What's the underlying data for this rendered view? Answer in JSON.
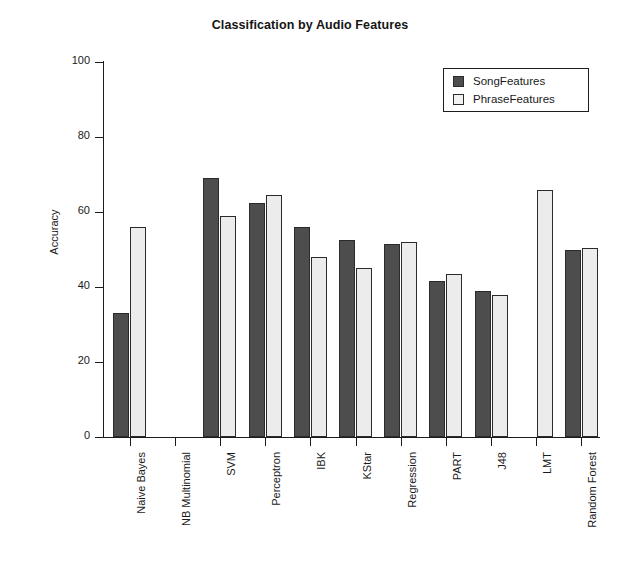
{
  "chart_data": {
    "type": "bar",
    "title": "Classification by Audio Features",
    "xlabel": "",
    "ylabel": "Accuracy",
    "ylim": [
      0,
      100
    ],
    "yticks": [
      0,
      20,
      40,
      60,
      80,
      100
    ],
    "grid": false,
    "legend_position": "top-right",
    "categories": [
      "Naive Bayes",
      "NB Multinomial",
      "SVM",
      "Perceptron",
      "IBK",
      "KStar",
      "Regression",
      "PART",
      "J48",
      "LMT",
      "Random Forest"
    ],
    "series": [
      {
        "name": "SongFeatures",
        "color": "#4d4d4d",
        "values": [
          33,
          0,
          69,
          62.5,
          56,
          52.5,
          51.5,
          41.5,
          39,
          0,
          50
        ]
      },
      {
        "name": "PhraseFeatures",
        "color": "#ececec",
        "values": [
          56,
          0,
          59,
          64.5,
          48,
          45,
          52,
          43.5,
          38,
          66,
          50.5
        ]
      }
    ]
  },
  "legend": {
    "items": [
      {
        "label": "SongFeatures"
      },
      {
        "label": "PhraseFeatures"
      }
    ]
  }
}
